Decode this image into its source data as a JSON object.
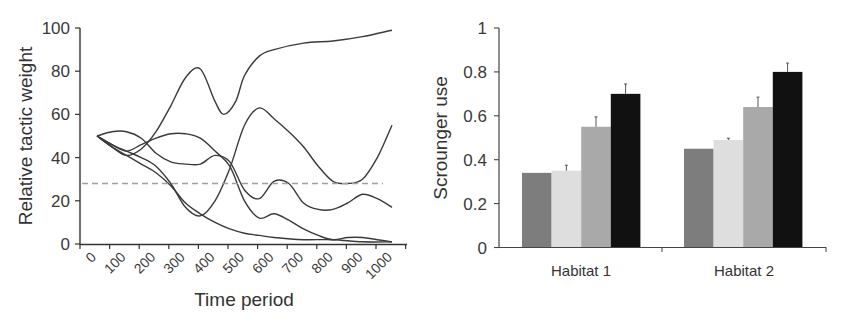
{
  "chart_data": [
    {
      "type": "line",
      "title": "",
      "xlabel": "Time period",
      "ylabel": "Relative tactic weight",
      "ylim": [
        0,
        100
      ],
      "yticks": [
        0,
        20,
        40,
        60,
        80,
        100
      ],
      "categories": [
        "0",
        "100",
        "200",
        "300",
        "400",
        "500",
        "600",
        "700",
        "800",
        "900",
        "1000"
      ],
      "grid": false,
      "legend": null,
      "reference_line": {
        "style": "dashed",
        "color": "#999999",
        "y": 28
      },
      "series": [
        {
          "name": "Tactic A",
          "x": [
            0,
            50,
            100,
            150,
            200,
            250,
            300,
            350,
            400,
            430,
            470,
            500,
            550,
            600,
            700,
            800,
            900,
            1000
          ],
          "values": [
            50,
            45,
            41,
            44,
            52,
            64,
            77,
            81,
            66,
            60,
            66,
            78,
            87,
            90,
            93,
            94,
            96,
            99
          ]
        },
        {
          "name": "Tactic B",
          "x": [
            0,
            50,
            100,
            150,
            200,
            250,
            300,
            350,
            400,
            450,
            500,
            550,
            600,
            650,
            700,
            750,
            800,
            850,
            900,
            950,
            1000
          ],
          "values": [
            50,
            46,
            43,
            40,
            36,
            28,
            17,
            13,
            20,
            35,
            55,
            63,
            58,
            52,
            45,
            36,
            29,
            28,
            30,
            40,
            55
          ]
        },
        {
          "name": "Tactic C",
          "x": [
            0,
            50,
            100,
            150,
            200,
            250,
            300,
            350,
            400,
            450,
            500,
            550,
            600,
            650,
            700,
            750,
            800,
            850,
            900,
            950,
            1000
          ],
          "values": [
            50,
            52,
            52,
            49,
            42,
            38,
            37,
            37,
            41,
            38,
            25,
            21,
            29,
            28,
            19,
            16,
            16,
            19,
            23,
            21,
            17
          ]
        },
        {
          "name": "Tactic D",
          "x": [
            0,
            50,
            100,
            150,
            200,
            250,
            300,
            350,
            400,
            450,
            500,
            550,
            600,
            650,
            700,
            750,
            800,
            850,
            900,
            950,
            1000
          ],
          "values": [
            50,
            46,
            43,
            46,
            49,
            51,
            51,
            49,
            43,
            36,
            20,
            12,
            14,
            11,
            7,
            4,
            2,
            3,
            3,
            2,
            1
          ]
        },
        {
          "name": "Tactic E",
          "x": [
            0,
            50,
            100,
            150,
            200,
            250,
            300,
            350,
            400,
            450,
            500,
            550,
            600,
            700,
            800,
            900,
            1000
          ],
          "values": [
            50,
            45,
            41,
            37,
            33,
            27,
            19,
            14,
            10,
            7,
            5,
            4,
            3,
            2,
            2,
            1,
            1
          ]
        }
      ]
    },
    {
      "type": "bar",
      "title": "",
      "xlabel": "",
      "ylabel": "Scrounger use",
      "ylim": [
        0,
        1
      ],
      "yticks": [
        "0",
        "0.2",
        "0.4",
        "0.6",
        "0.8",
        "1"
      ],
      "categories": [
        "Habitat 1",
        "Habitat 2"
      ],
      "grid": false,
      "legend": null,
      "series": [
        {
          "name": "Treatment 1",
          "color": "#7d7d7d",
          "values": [
            0.34,
            0.45
          ],
          "errors": [
            0.0,
            0.0
          ]
        },
        {
          "name": "Treatment 2",
          "color": "#dedede",
          "values": [
            0.35,
            0.49
          ],
          "errors": [
            0.025,
            0.008
          ]
        },
        {
          "name": "Treatment 3",
          "color": "#a9a9a9",
          "values": [
            0.55,
            0.64
          ],
          "errors": [
            0.045,
            0.045
          ]
        },
        {
          "name": "Treatment 4",
          "color": "#111111",
          "values": [
            0.7,
            0.8
          ],
          "errors": [
            0.045,
            0.04
          ]
        }
      ]
    }
  ],
  "left": {
    "ylabel": "Relative tactic weight",
    "xlabel": "Time period",
    "yticks": [
      "0",
      "20",
      "40",
      "60",
      "80",
      "100"
    ],
    "xticks": [
      "0",
      "100",
      "200",
      "300",
      "400",
      "500",
      "600",
      "700",
      "800",
      "900",
      "1000"
    ]
  },
  "right": {
    "ylabel": "Scrounger use",
    "yticks": [
      "0",
      "0.2",
      "0.4",
      "0.6",
      "0.8",
      "1"
    ],
    "categories": [
      "Habitat 1",
      "Habitat 2"
    ]
  }
}
